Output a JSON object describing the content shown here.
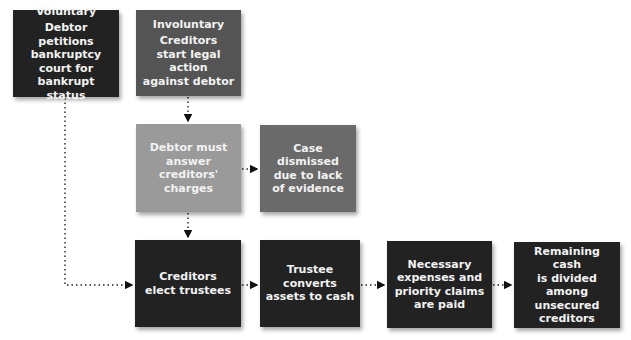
{
  "diagram": {
    "type": "flowchart",
    "nodes": [
      {
        "id": "voluntary",
        "title": "Voluntary",
        "text": "Debtor petitions bankruptcy court for bankrupt status",
        "lines": [
          "Debtor petitions",
          "bankruptcy",
          "court for",
          "bankrupt status"
        ],
        "color": "#222222"
      },
      {
        "id": "involuntary",
        "title": "Involuntary",
        "text": "Creditors start legal action against debtor",
        "lines": [
          "Creditors",
          "start legal action",
          "against debtor"
        ],
        "color": "#545454"
      },
      {
        "id": "answer",
        "text": "Debtor must answer creditors' charges",
        "lines": [
          "Debtor must",
          "answer",
          "creditors'",
          "charges"
        ],
        "color": "#9a9a9a"
      },
      {
        "id": "dismissed",
        "text": "Case dismissed due to lack of evidence",
        "lines": [
          "Case dismissed",
          "due to lack",
          "of evidence"
        ],
        "color": "#6a6a6a"
      },
      {
        "id": "elect",
        "text": "Creditors elect trustees",
        "lines": [
          "Creditors",
          "elect trustees"
        ],
        "color": "#222222"
      },
      {
        "id": "convert",
        "text": "Trustee converts assets to cash",
        "lines": [
          "Trustee converts",
          "assets to cash"
        ],
        "color": "#222222"
      },
      {
        "id": "expenses",
        "text": "Necessary expenses and priority claims are paid",
        "lines": [
          "Necessary",
          "expenses and",
          "priority claims",
          "are paid"
        ],
        "color": "#222222"
      },
      {
        "id": "divided",
        "text": "Remaining cash is divided among unsecured creditors",
        "lines": [
          "Remaining cash",
          "is divided",
          "among",
          "unsecured",
          "creditors"
        ],
        "color": "#222222"
      }
    ],
    "edges": [
      {
        "from": "involuntary",
        "to": "answer",
        "style": "dotted"
      },
      {
        "from": "answer",
        "to": "dismissed",
        "style": "dotted"
      },
      {
        "from": "answer",
        "to": "elect",
        "style": "dotted"
      },
      {
        "from": "voluntary",
        "to": "elect",
        "style": "dotted"
      },
      {
        "from": "elect",
        "to": "convert",
        "style": "dotted"
      },
      {
        "from": "convert",
        "to": "expenses",
        "style": "dotted"
      },
      {
        "from": "expenses",
        "to": "divided",
        "style": "dotted"
      }
    ]
  }
}
